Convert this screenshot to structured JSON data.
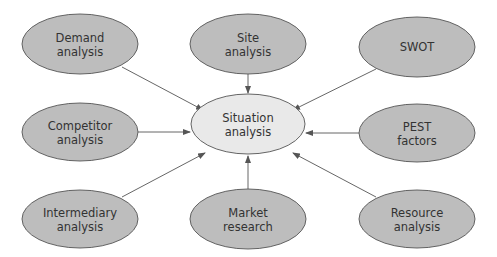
{
  "diagram": {
    "type": "hub-and-spoke",
    "colors": {
      "outer_fill": "#bdbdbd",
      "center_fill": "#e9e9e9",
      "stroke": "#555555",
      "arrow": "#555555",
      "text": "#333333"
    },
    "center": {
      "id": "situation",
      "lines": [
        "Situation",
        "analysis"
      ]
    },
    "nodes": [
      {
        "id": "demand",
        "lines": [
          "Demand",
          "analysis"
        ]
      },
      {
        "id": "site",
        "lines": [
          "Site",
          "analysis"
        ]
      },
      {
        "id": "swot",
        "lines": [
          "SWOT"
        ]
      },
      {
        "id": "competitor",
        "lines": [
          "Competitor",
          "analysis"
        ]
      },
      {
        "id": "pest",
        "lines": [
          "PEST",
          "factors"
        ]
      },
      {
        "id": "intermediary",
        "lines": [
          "Intermediary",
          "analysis"
        ]
      },
      {
        "id": "market",
        "lines": [
          "Market",
          "research"
        ]
      },
      {
        "id": "resource",
        "lines": [
          "Resource",
          "analysis"
        ]
      }
    ],
    "edges": [
      {
        "from": "demand",
        "to": "situation"
      },
      {
        "from": "site",
        "to": "situation"
      },
      {
        "from": "swot",
        "to": "situation"
      },
      {
        "from": "competitor",
        "to": "situation"
      },
      {
        "from": "pest",
        "to": "situation"
      },
      {
        "from": "intermediary",
        "to": "situation"
      },
      {
        "from": "market",
        "to": "situation"
      },
      {
        "from": "resource",
        "to": "situation"
      }
    ]
  }
}
